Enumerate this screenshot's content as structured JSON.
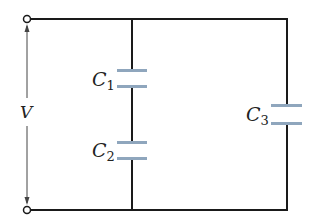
{
  "diagram": {
    "type": "circuit",
    "labels": {
      "voltage": "V",
      "c1": {
        "main": "C",
        "sub": "1"
      },
      "c2": {
        "main": "C",
        "sub": "2"
      },
      "c3": {
        "main": "C",
        "sub": "3"
      }
    },
    "colors": {
      "wire": "#1a1a1a",
      "plate": "#8fa6bd",
      "arrow": "#444444"
    }
  }
}
